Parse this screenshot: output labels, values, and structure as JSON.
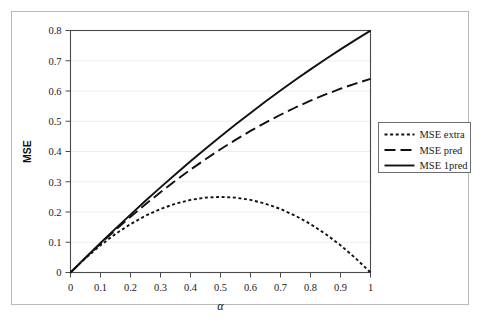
{
  "figure": {
    "background_color": "#ffffff",
    "frame_color": "#b9b9b9",
    "axis_color": "#4a4a4a",
    "grid_color": "#eeeeee",
    "curve_color": "#111111"
  },
  "chart_data": {
    "type": "line",
    "title": "",
    "subtitle": "",
    "xlabel": "α",
    "ylabel": "MSE",
    "xlim": [
      0,
      1
    ],
    "ylim": [
      0,
      0.8
    ],
    "grid": true,
    "grid_axis": "y",
    "legend_position": "right-outside",
    "x_ticks": [
      0,
      0.1,
      0.2,
      0.3,
      0.4,
      0.5,
      0.6,
      0.7,
      0.8,
      0.9,
      1
    ],
    "x_tick_labels": [
      "0",
      "0.1",
      "0.2",
      "0.3",
      "0.4",
      "0.5",
      "0.6",
      "0.7",
      "0.8",
      "0.9",
      "1"
    ],
    "y_ticks": [
      0,
      0.1,
      0.2,
      0.3,
      0.4,
      0.5,
      0.6,
      0.7,
      0.8
    ],
    "y_tick_labels": [
      "0",
      "0.1",
      "0.2",
      "0.3",
      "0.4",
      "0.5",
      "0.6",
      "0.7",
      "0.8"
    ],
    "x": [
      0,
      0.05,
      0.1,
      0.15,
      0.2,
      0.25,
      0.3,
      0.35,
      0.4,
      0.45,
      0.5,
      0.55,
      0.6,
      0.65,
      0.7,
      0.75,
      0.8,
      0.85,
      0.9,
      0.95,
      1
    ],
    "series": [
      {
        "name": "MSE extra",
        "style": "dotted",
        "color": "#111111",
        "values": [
          0,
          0.0475,
          0.09,
          0.1275,
          0.16,
          0.1875,
          0.21,
          0.2275,
          0.24,
          0.2475,
          0.25,
          0.2475,
          0.24,
          0.2275,
          0.21,
          0.1875,
          0.16,
          0.1275,
          0.09,
          0.0475,
          0
        ]
      },
      {
        "name": "MSE pred",
        "style": "dashed",
        "color": "#111111",
        "values": [
          0,
          0.0485,
          0.0955,
          0.1405,
          0.184,
          0.2255,
          0.2655,
          0.3035,
          0.34,
          0.3745,
          0.4075,
          0.4385,
          0.468,
          0.4955,
          0.5215,
          0.5455,
          0.568,
          0.5885,
          0.6075,
          0.6245,
          0.64
        ]
      },
      {
        "name": "MSE 1pred",
        "style": "solid",
        "color": "#111111",
        "values": [
          0,
          0.049,
          0.0975,
          0.145,
          0.1915,
          0.237,
          0.2815,
          0.325,
          0.3675,
          0.409,
          0.4495,
          0.489,
          0.5275,
          0.565,
          0.6015,
          0.637,
          0.6715,
          0.705,
          0.7375,
          0.769,
          0.7995
        ]
      }
    ]
  },
  "legend": {
    "entries": [
      {
        "label": "MSE extra",
        "style": "dotted"
      },
      {
        "label": "MSE pred",
        "style": "dashed"
      },
      {
        "label": "MSE 1pred",
        "style": "solid"
      }
    ]
  }
}
